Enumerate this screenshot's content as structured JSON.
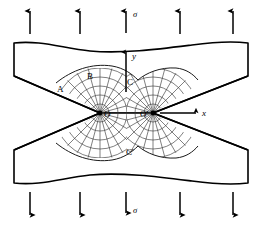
{
  "figure": {
    "stroke_color": "#000000",
    "background_color": "#ffffff",
    "grid_color": "#444444"
  },
  "labels": {
    "sigma_top": "σ",
    "sigma_bottom": "σ",
    "axis_y": "y",
    "axis_x": "x",
    "point_A": "A",
    "point_B": "B",
    "point_C": "C",
    "point_C_prime": "C'",
    "origin_O": "O",
    "origin_O_prime": "O'"
  },
  "load_arrows": {
    "top": {
      "direction": "up",
      "count": 5,
      "x_positions": [
        30,
        80,
        126,
        180,
        233
      ],
      "y_tail": 34,
      "y_head": 9,
      "sigma_label_at_x": 126
    },
    "bottom": {
      "direction": "down",
      "count": 5,
      "x_positions": [
        30,
        80,
        126,
        180,
        233
      ],
      "y_tail": 192,
      "y_head": 217,
      "sigma_label_at_x": 126
    }
  },
  "axes": {
    "y_axis": {
      "x": 126,
      "y_tail": 92,
      "y_head": 50,
      "label": "y",
      "label_x": 133,
      "label_y": 57
    },
    "x_axis": {
      "y": 113,
      "x_tail": 160,
      "x_head": 198,
      "label": "x",
      "label_x": 203,
      "label_y": 116
    }
  },
  "notch_tips": [
    {
      "name": "O",
      "cx": 100,
      "cy": 113,
      "label_x": 104,
      "label_y": 117
    },
    {
      "name": "O'",
      "cx": 153,
      "cy": 113,
      "label_x": 141,
      "label_y": 117
    }
  ],
  "annotation_points": [
    {
      "name": "A",
      "x": 59,
      "y": 89
    },
    {
      "name": "B",
      "x": 89,
      "y": 76
    },
    {
      "name": "C",
      "x": 129,
      "y": 82
    },
    {
      "name": "C'",
      "x": 128,
      "y": 152
    }
  ],
  "specimen": {
    "top_block": {
      "left_x": 14,
      "right_x": 248,
      "top_y": 41,
      "wave": "sinusoidal top edge",
      "notch_vertex_left": {
        "x": 100,
        "y": 113
      },
      "notch_vertex_right": {
        "x": 153,
        "y": 113
      },
      "side_bottom_y": 76
    },
    "bottom_block": {
      "left_x": 14,
      "right_x": 248,
      "bottom_y": 185,
      "wave": "sinusoidal bottom edge",
      "notch_vertex_left": {
        "x": 100,
        "y": 113
      },
      "notch_vertex_right": {
        "x": 153,
        "y": 113
      },
      "side_top_y": 150
    }
  },
  "stress_field": {
    "description": "Curvilinear orthogonal net of principal stress trajectories around both notch tips",
    "radial_lines_per_tip": 16,
    "arc_rings_per_tip": 5,
    "max_radius": 46
  }
}
